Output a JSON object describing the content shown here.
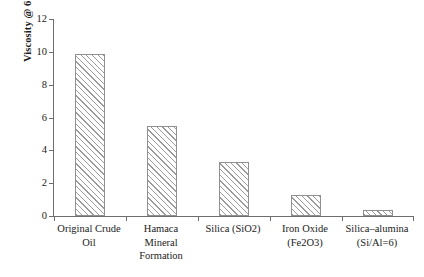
{
  "chart_data": {
    "type": "bar",
    "title": "",
    "subtitle": "",
    "xlabel": "",
    "ylabel": "Viscosity @ 60°C (Pa s)",
    "ylabel_parts": {
      "prefix": "Viscosity @ 60",
      "degree": "o",
      "suffix": "C (Pa s)"
    },
    "categories": [
      "Original Crude Oil",
      "Hamaca Mineral Formation",
      "Silica (SiO2)",
      "Iron Oxide (Fe2O3)",
      "Silica–alumina (Si/Al=6)"
    ],
    "category_lines": [
      [
        "Original Crude",
        "Oil"
      ],
      [
        "Hamaca",
        "Mineral",
        "Formation"
      ],
      [
        "Silica (SiO2)"
      ],
      [
        "Iron Oxide",
        "(Fe2O3)"
      ],
      [
        "Silica–alumina",
        "(Si/Al=6)"
      ]
    ],
    "values": [
      9.85,
      5.5,
      3.3,
      1.3,
      0.35
    ],
    "ylim": [
      0,
      12
    ],
    "ytick_values": [
      0,
      2,
      4,
      6,
      8,
      10,
      12
    ],
    "ytick_labels": [
      "0",
      "2",
      "4",
      "6",
      "8",
      "10",
      "12"
    ],
    "grid": false,
    "legend": null,
    "legend_position": "none",
    "bar_fill": "diagonal-hatch",
    "bar_edge_color": "#909090",
    "hatch_color": "#9a9a9a",
    "axis_color": "#6e6e6e",
    "text_color": "#1a1a1a",
    "background_color": "#ffffff"
  }
}
